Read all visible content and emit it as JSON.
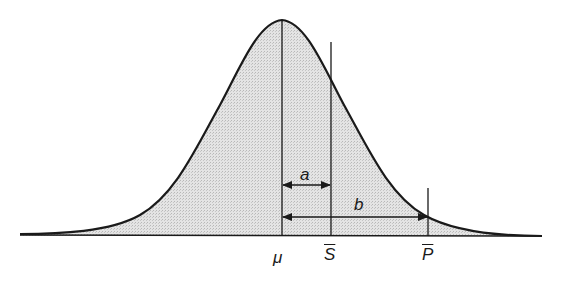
{
  "diagram": {
    "type": "normal-distribution-curve",
    "fill_color": "#dcdcdc",
    "stroke_color": "#1a1a1a",
    "markers": [
      {
        "id": "mu",
        "label": "μ",
        "x": 282
      },
      {
        "id": "s_bar",
        "label": "S",
        "overline": true,
        "x": 331
      },
      {
        "id": "p_bar",
        "label": "P",
        "overline": true,
        "x": 428
      }
    ],
    "distances": [
      {
        "id": "a",
        "label": "a",
        "from": "mu",
        "to": "s_bar"
      },
      {
        "id": "b",
        "label": "b",
        "from": "mu",
        "to": "p_bar"
      }
    ]
  }
}
